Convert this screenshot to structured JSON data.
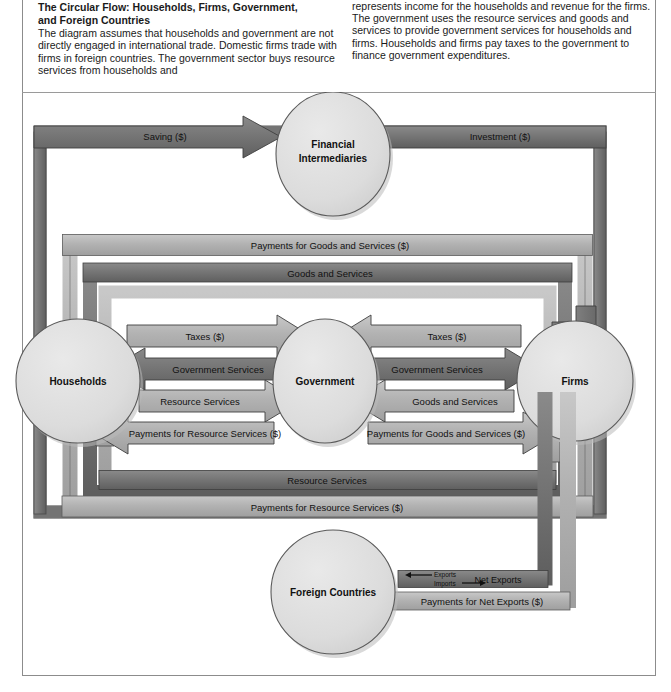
{
  "caption": {
    "title_line1": "The Circular Flow: Households, Firms, Government,",
    "title_line2": "and Foreign Countries",
    "left_body": "The diagram assumes that households and government are not directly engaged in international trade. Domestic firms trade with firms in foreign countries. The government sector buys resource services from households and",
    "right_body": "represents income for the households and revenue for the firms. The government uses the resource services and goods and services to provide government services for households and firms. Households and firms pay taxes to the government to finance government expenditures."
  },
  "nodes": {
    "financial_intermediaries_line1": "Financial",
    "financial_intermediaries_line2": "Intermediaries",
    "households": "Households",
    "government": "Government",
    "firms": "Firms",
    "foreign_countries": "Foreign Countries"
  },
  "flows": {
    "saving": "Saving ($)",
    "investment": "Investment ($)",
    "payments_goods_services": "Payments for Goods and Services ($)",
    "goods_and_services": "Goods and Services",
    "resource_services": "Resource Services",
    "payments_resource_services": "Payments for Resource Services ($)",
    "taxes_left": "Taxes ($)",
    "taxes_right": "Taxes ($)",
    "gov_services_left": "Government Services",
    "gov_services_right": "Government Services",
    "resource_services_center": "Resource Services",
    "goods_services_center": "Goods and Services",
    "payments_resource_center": "Payments for Resource Services ($)",
    "payments_goods_center": "Payments for Goods and Services ($)",
    "net_exports": "Net Exports",
    "exports": "Exports",
    "imports": "Imports",
    "payments_net_exports": "Payments for Net Exports ($)"
  },
  "colors": {
    "band_dark": "#6e6e6e",
    "band_mid": "#9a9a9a",
    "band_light": "#b9b9b9",
    "band_pale": "#cfcfcf",
    "circle_fill": "#dedede",
    "outline": "#4a4a4a",
    "page_bg": "#ffffff",
    "text": "#111111"
  }
}
